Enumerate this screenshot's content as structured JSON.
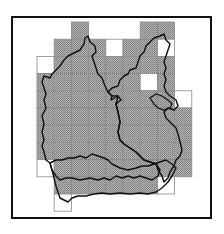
{
  "figure": {
    "title": "",
    "colors": {
      "shaded": "#9a9a9a",
      "hatch_dark": "#6e6e6e",
      "grid_line": "#8a8a8a",
      "empty_cell": "#ffffff",
      "outline": "#111111",
      "frame": "#111111"
    },
    "grid": {
      "columns": 10,
      "rows": 11,
      "cells": [
        {
          "row": 0,
          "col": 2,
          "state": "shaded"
        },
        {
          "row": 0,
          "col": 6,
          "state": "shaded"
        },
        {
          "row": 0,
          "col": 7,
          "state": "shaded"
        },
        {
          "row": 1,
          "col": 1,
          "state": "shaded"
        },
        {
          "row": 1,
          "col": 2,
          "state": "shaded"
        },
        {
          "row": 1,
          "col": 3,
          "state": "shaded"
        },
        {
          "row": 1,
          "col": 4,
          "state": "empty"
        },
        {
          "row": 1,
          "col": 5,
          "state": "shaded"
        },
        {
          "row": 1,
          "col": 6,
          "state": "shaded"
        },
        {
          "row": 1,
          "col": 7,
          "state": "empty"
        },
        {
          "row": 2,
          "col": 0,
          "state": "empty"
        },
        {
          "row": 2,
          "col": 1,
          "state": "shaded"
        },
        {
          "row": 2,
          "col": 2,
          "state": "shaded"
        },
        {
          "row": 2,
          "col": 3,
          "state": "shaded"
        },
        {
          "row": 2,
          "col": 4,
          "state": "shaded"
        },
        {
          "row": 2,
          "col": 5,
          "state": "shaded"
        },
        {
          "row": 2,
          "col": 6,
          "state": "shaded"
        },
        {
          "row": 2,
          "col": 7,
          "state": "shaded"
        },
        {
          "row": 3,
          "col": 0,
          "state": "shaded"
        },
        {
          "row": 3,
          "col": 1,
          "state": "shaded"
        },
        {
          "row": 3,
          "col": 2,
          "state": "shaded"
        },
        {
          "row": 3,
          "col": 3,
          "state": "shaded"
        },
        {
          "row": 3,
          "col": 4,
          "state": "shaded"
        },
        {
          "row": 3,
          "col": 5,
          "state": "shaded"
        },
        {
          "row": 3,
          "col": 6,
          "state": "empty"
        },
        {
          "row": 3,
          "col": 7,
          "state": "shaded"
        },
        {
          "row": 4,
          "col": 0,
          "state": "shaded"
        },
        {
          "row": 4,
          "col": 1,
          "state": "shaded"
        },
        {
          "row": 4,
          "col": 2,
          "state": "shaded"
        },
        {
          "row": 4,
          "col": 3,
          "state": "shaded"
        },
        {
          "row": 4,
          "col": 4,
          "state": "shaded"
        },
        {
          "row": 4,
          "col": 5,
          "state": "shaded"
        },
        {
          "row": 4,
          "col": 6,
          "state": "shaded"
        },
        {
          "row": 4,
          "col": 7,
          "state": "shaded"
        },
        {
          "row": 4,
          "col": 8,
          "state": "empty"
        },
        {
          "row": 5,
          "col": 0,
          "state": "shaded"
        },
        {
          "row": 5,
          "col": 1,
          "state": "shaded"
        },
        {
          "row": 5,
          "col": 2,
          "state": "shaded"
        },
        {
          "row": 5,
          "col": 3,
          "state": "shaded"
        },
        {
          "row": 5,
          "col": 4,
          "state": "shaded"
        },
        {
          "row": 5,
          "col": 5,
          "state": "shaded"
        },
        {
          "row": 5,
          "col": 6,
          "state": "shaded"
        },
        {
          "row": 5,
          "col": 7,
          "state": "shaded"
        },
        {
          "row": 5,
          "col": 8,
          "state": "shaded"
        },
        {
          "row": 6,
          "col": 0,
          "state": "shaded"
        },
        {
          "row": 6,
          "col": 1,
          "state": "shaded"
        },
        {
          "row": 6,
          "col": 2,
          "state": "shaded"
        },
        {
          "row": 6,
          "col": 3,
          "state": "shaded"
        },
        {
          "row": 6,
          "col": 4,
          "state": "shaded"
        },
        {
          "row": 6,
          "col": 5,
          "state": "shaded"
        },
        {
          "row": 6,
          "col": 6,
          "state": "shaded"
        },
        {
          "row": 6,
          "col": 7,
          "state": "shaded"
        },
        {
          "row": 6,
          "col": 8,
          "state": "shaded"
        },
        {
          "row": 7,
          "col": 0,
          "state": "shaded"
        },
        {
          "row": 7,
          "col": 1,
          "state": "shaded"
        },
        {
          "row": 7,
          "col": 2,
          "state": "shaded"
        },
        {
          "row": 7,
          "col": 3,
          "state": "shaded"
        },
        {
          "row": 7,
          "col": 4,
          "state": "shaded"
        },
        {
          "row": 7,
          "col": 5,
          "state": "shaded"
        },
        {
          "row": 7,
          "col": 6,
          "state": "shaded"
        },
        {
          "row": 7,
          "col": 7,
          "state": "shaded"
        },
        {
          "row": 7,
          "col": 8,
          "state": "shaded"
        },
        {
          "row": 8,
          "col": 0,
          "state": "empty"
        },
        {
          "row": 8,
          "col": 1,
          "state": "shaded"
        },
        {
          "row": 8,
          "col": 2,
          "state": "shaded"
        },
        {
          "row": 8,
          "col": 3,
          "state": "shaded"
        },
        {
          "row": 8,
          "col": 4,
          "state": "shaded"
        },
        {
          "row": 8,
          "col": 5,
          "state": "shaded"
        },
        {
          "row": 8,
          "col": 6,
          "state": "shaded"
        },
        {
          "row": 8,
          "col": 7,
          "state": "shaded"
        },
        {
          "row": 8,
          "col": 8,
          "state": "shaded"
        },
        {
          "row": 9,
          "col": 1,
          "state": "shaded"
        },
        {
          "row": 9,
          "col": 2,
          "state": "shaded"
        },
        {
          "row": 9,
          "col": 3,
          "state": "shaded"
        },
        {
          "row": 9,
          "col": 4,
          "state": "shaded"
        },
        {
          "row": 9,
          "col": 5,
          "state": "shaded"
        },
        {
          "row": 9,
          "col": 6,
          "state": "shaded"
        },
        {
          "row": 9,
          "col": 7,
          "state": "empty"
        },
        {
          "row": 10,
          "col": 1,
          "state": "empty"
        }
      ]
    }
  }
}
